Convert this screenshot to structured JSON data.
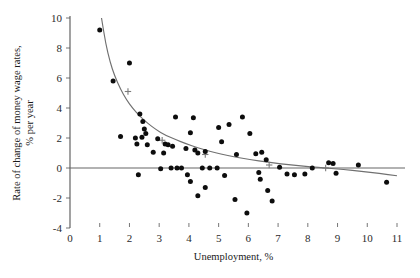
{
  "chart_data": {
    "type": "scatter",
    "title": "",
    "xlabel": "Unemployment, %",
    "ylabel": "Rate of change of money wage rates, % per year",
    "ylabel_line1": "Rate of change of money wage rates,",
    "ylabel_line2": "% per year",
    "xlim": [
      0,
      11
    ],
    "ylim": [
      -4,
      10
    ],
    "xticks": [
      0,
      1,
      2,
      3,
      4,
      5,
      6,
      7,
      8,
      9,
      10,
      11
    ],
    "xtick_labels": [
      "0",
      "1",
      "2",
      "3",
      "4",
      "5",
      "6",
      "7",
      "8",
      "9",
      "10",
      "11"
    ],
    "yticks": [
      -4,
      -2,
      0,
      2,
      4,
      6,
      8,
      10
    ],
    "ytick_labels": [
      "-4",
      "-2",
      "0",
      "2",
      "4",
      "6",
      "8",
      "10"
    ],
    "grid": false,
    "legend": false,
    "zero_line": true,
    "series": [
      {
        "name": "observations",
        "marker": "filled-circle",
        "color": "#0d0d0d",
        "points": [
          [
            1.0,
            9.2
          ],
          [
            1.45,
            5.8
          ],
          [
            2.0,
            7.0
          ],
          [
            2.35,
            3.6
          ],
          [
            2.45,
            3.1
          ],
          [
            2.5,
            2.6
          ],
          [
            2.55,
            2.3
          ],
          [
            2.42,
            2.05
          ],
          [
            1.7,
            2.1
          ],
          [
            2.2,
            2.0
          ],
          [
            2.25,
            1.6
          ],
          [
            2.6,
            1.55
          ],
          [
            2.95,
            1.95
          ],
          [
            3.2,
            1.6
          ],
          [
            3.3,
            1.55
          ],
          [
            2.8,
            1.05
          ],
          [
            3.15,
            1.0
          ],
          [
            3.55,
            3.4
          ],
          [
            3.45,
            1.45
          ],
          [
            4.05,
            2.35
          ],
          [
            4.15,
            3.35
          ],
          [
            3.9,
            1.3
          ],
          [
            4.2,
            1.2
          ],
          [
            4.3,
            1.0
          ],
          [
            4.55,
            1.1
          ],
          [
            5.0,
            2.7
          ],
          [
            5.1,
            1.75
          ],
          [
            5.35,
            2.9
          ],
          [
            5.6,
            0.9
          ],
          [
            5.8,
            3.4
          ],
          [
            6.05,
            2.3
          ],
          [
            6.25,
            0.95
          ],
          [
            6.45,
            1.05
          ],
          [
            6.6,
            0.55
          ],
          [
            2.3,
            -0.45
          ],
          [
            3.05,
            -0.05
          ],
          [
            3.4,
            0.0
          ],
          [
            3.6,
            0.0
          ],
          [
            3.75,
            0.0
          ],
          [
            3.95,
            -0.45
          ],
          [
            4.05,
            -0.9
          ],
          [
            4.45,
            0.0
          ],
          [
            4.7,
            0.0
          ],
          [
            4.95,
            0.0
          ],
          [
            5.2,
            -0.5
          ],
          [
            5.55,
            -2.1
          ],
          [
            4.55,
            -1.3
          ],
          [
            4.3,
            -1.85
          ],
          [
            5.95,
            -3.0
          ],
          [
            6.35,
            -0.3
          ],
          [
            6.4,
            -0.75
          ],
          [
            6.65,
            -1.5
          ],
          [
            6.8,
            -2.2
          ],
          [
            7.05,
            0.05
          ],
          [
            7.3,
            -0.4
          ],
          [
            7.55,
            -0.45
          ],
          [
            7.9,
            -0.4
          ],
          [
            8.15,
            0.0
          ],
          [
            8.7,
            0.35
          ],
          [
            8.85,
            0.3
          ],
          [
            8.95,
            -0.35
          ],
          [
            9.7,
            0.2
          ],
          [
            10.65,
            -0.95
          ]
        ]
      },
      {
        "name": "fitted-curve-markers",
        "marker": "plus",
        "color": "#7a7a7a",
        "points": [
          [
            1.95,
            5.1
          ],
          [
            3.1,
            1.85
          ],
          [
            4.55,
            0.9
          ],
          [
            6.7,
            0.2
          ],
          [
            8.6,
            0.0
          ]
        ]
      }
    ],
    "fit_curve": {
      "name": "fitted Phillips curve",
      "color": "#707070",
      "points": [
        [
          1.06,
          10.0
        ],
        [
          1.2,
          8.3
        ],
        [
          1.35,
          7.05
        ],
        [
          1.5,
          6.15
        ],
        [
          1.7,
          5.25
        ],
        [
          1.9,
          4.55
        ],
        [
          2.1,
          4.0
        ],
        [
          2.35,
          3.45
        ],
        [
          2.6,
          3.0
        ],
        [
          2.9,
          2.55
        ],
        [
          3.2,
          2.2
        ],
        [
          3.55,
          1.9
        ],
        [
          3.9,
          1.62
        ],
        [
          4.3,
          1.35
        ],
        [
          4.7,
          1.12
        ],
        [
          5.1,
          0.92
        ],
        [
          5.6,
          0.72
        ],
        [
          6.1,
          0.55
        ],
        [
          6.6,
          0.4
        ],
        [
          7.1,
          0.28
        ],
        [
          7.6,
          0.17
        ],
        [
          8.1,
          0.08
        ],
        [
          8.6,
          0.0
        ],
        [
          9.2,
          -0.1
        ],
        [
          9.8,
          -0.22
        ],
        [
          10.4,
          -0.36
        ],
        [
          11.0,
          -0.52
        ]
      ]
    }
  }
}
